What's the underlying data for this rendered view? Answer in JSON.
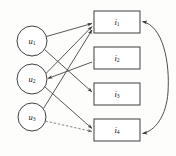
{
  "diagram": {
    "stroke_color": "#3a3a3a",
    "node_fill": "#ffffff",
    "background": "#fdfdfb",
    "latent_nodes": [
      {
        "id": "u1",
        "label": "u",
        "subscript": "1",
        "cx": 32,
        "cy": 41,
        "r": 15
      },
      {
        "id": "u2",
        "label": "u",
        "subscript": "2",
        "cx": 32,
        "cy": 79,
        "r": 15
      },
      {
        "id": "u3",
        "label": "u",
        "subscript": "3",
        "cx": 32,
        "cy": 117,
        "r": 14
      }
    ],
    "indicator_nodes": [
      {
        "id": "i1",
        "label": "i",
        "subscript": "1",
        "x": 94,
        "y": 11,
        "w": 46,
        "h": 22
      },
      {
        "id": "i2",
        "label": "i",
        "subscript": "2",
        "x": 94,
        "y": 47,
        "w": 46,
        "h": 22
      },
      {
        "id": "i3",
        "label": "i",
        "subscript": "3",
        "x": 94,
        "y": 83,
        "w": 46,
        "h": 22
      },
      {
        "id": "i4",
        "label": "i",
        "subscript": "4",
        "x": 94,
        "y": 119,
        "w": 46,
        "h": 22
      }
    ],
    "edges": [
      {
        "from": "u1",
        "to": "i1",
        "style": "solid",
        "arrow": "end"
      },
      {
        "from": "u1",
        "to": "i3",
        "style": "solid",
        "arrow": "end"
      },
      {
        "from": "u2",
        "to": "i1",
        "style": "solid",
        "arrow": "end"
      },
      {
        "from": "u2",
        "to": "i4",
        "style": "solid",
        "arrow": "end"
      },
      {
        "from": "i1",
        "to": "u2",
        "style": "solid",
        "arrow": "end"
      },
      {
        "from": "u3",
        "to": "i1",
        "style": "solid",
        "arrow": "end"
      },
      {
        "from": "u3",
        "to": "i4",
        "style": "dashed",
        "arrow": "end"
      },
      {
        "from": "i2",
        "to": "u2",
        "style": "solid",
        "arrow": "none"
      },
      {
        "from": "i1",
        "to": "i4",
        "style": "curved",
        "arrow": "both"
      }
    ],
    "bleed_text": ""
  }
}
